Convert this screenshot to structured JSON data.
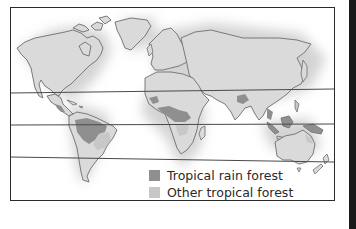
{
  "map": {
    "type": "world-thematic-map",
    "subject": "Distribution of tropical forests",
    "reference_lines": [
      "Tropic of Cancer",
      "Equator",
      "Tropic of Capricorn"
    ],
    "colors": {
      "land": "#dadada",
      "coast": "#6e6e6e",
      "rain_forest": "#8f8f8f",
      "other_forest": "#c8c8c8",
      "lines": "#4a4a4a",
      "frame": "#2a2a2a"
    }
  },
  "legend": {
    "items": [
      {
        "label": "Tropical rain forest",
        "color": "#8f8f8f"
      },
      {
        "label": "Other tropical forest",
        "color": "#c8c8c8"
      }
    ]
  }
}
